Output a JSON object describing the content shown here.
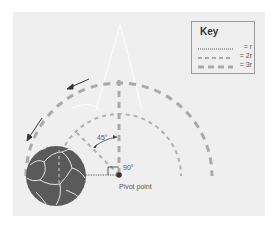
{
  "key": {
    "title": "Key",
    "items": [
      {
        "style": "dotted",
        "label": "= r"
      },
      {
        "style": "dashed",
        "label": "= 2r"
      },
      {
        "style": "thick-dashed",
        "label": "= 3r"
      }
    ]
  },
  "annotations": {
    "angle_45": "45°",
    "angle_90": "90°",
    "pivot": "Pivot point"
  },
  "colors": {
    "background": "#efefef",
    "arc": "#a9a9a9",
    "ball": "#5a5a5a",
    "pivot": "#333333",
    "arrow": "#333333"
  }
}
